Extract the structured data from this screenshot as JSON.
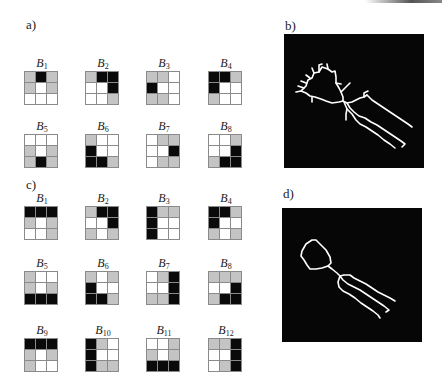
{
  "figure": {
    "panels": {
      "a": {
        "label": "a)",
        "blocks": [
          {
            "name": "B",
            "sub": "1",
            "cells": [
              "g",
              "b",
              "g",
              "g",
              "w",
              "g",
              "w",
              "w",
              "w"
            ]
          },
          {
            "name": "B",
            "sub": "2",
            "cells": [
              "g",
              "b",
              "b",
              "w",
              "w",
              "b",
              "w",
              "w",
              "g"
            ]
          },
          {
            "name": "B",
            "sub": "3",
            "cells": [
              "g",
              "g",
              "w",
              "b",
              "w",
              "w",
              "g",
              "g",
              "w"
            ]
          },
          {
            "name": "B",
            "sub": "4",
            "cells": [
              "b",
              "b",
              "g",
              "b",
              "w",
              "w",
              "g",
              "w",
              "w"
            ]
          },
          {
            "name": "B",
            "sub": "5",
            "cells": [
              "w",
              "w",
              "w",
              "g",
              "w",
              "g",
              "g",
              "b",
              "g"
            ]
          },
          {
            "name": "B",
            "sub": "6",
            "cells": [
              "g",
              "w",
              "w",
              "b",
              "w",
              "w",
              "b",
              "b",
              "g"
            ]
          },
          {
            "name": "B",
            "sub": "7",
            "cells": [
              "w",
              "g",
              "g",
              "w",
              "w",
              "b",
              "w",
              "g",
              "g"
            ]
          },
          {
            "name": "B",
            "sub": "8",
            "cells": [
              "w",
              "w",
              "g",
              "w",
              "w",
              "b",
              "g",
              "b",
              "b"
            ]
          }
        ]
      },
      "b": {
        "label": "b)",
        "description": "Skeleton image of object with spurious branches (white lines on black)"
      },
      "c": {
        "label": "c)",
        "blocks": [
          {
            "name": "B",
            "sub": "1",
            "cells": [
              "b",
              "b",
              "b",
              "g",
              "w",
              "g",
              "w",
              "w",
              "g"
            ]
          },
          {
            "name": "B",
            "sub": "2",
            "cells": [
              "g",
              "b",
              "b",
              "w",
              "w",
              "b",
              "g",
              "w",
              "g"
            ]
          },
          {
            "name": "B",
            "sub": "3",
            "cells": [
              "b",
              "g",
              "g",
              "b",
              "w",
              "w",
              "b",
              "w",
              "w"
            ]
          },
          {
            "name": "B",
            "sub": "4",
            "cells": [
              "b",
              "b",
              "g",
              "b",
              "w",
              "w",
              "g",
              "w",
              "g"
            ]
          },
          {
            "name": "B",
            "sub": "5",
            "cells": [
              "g",
              "w",
              "w",
              "g",
              "w",
              "g",
              "b",
              "b",
              "b"
            ]
          },
          {
            "name": "B",
            "sub": "6",
            "cells": [
              "g",
              "w",
              "g",
              "b",
              "w",
              "w",
              "b",
              "b",
              "g"
            ]
          },
          {
            "name": "B",
            "sub": "7",
            "cells": [
              "w",
              "g",
              "b",
              "w",
              "w",
              "b",
              "g",
              "g",
              "b"
            ]
          },
          {
            "name": "B",
            "sub": "8",
            "cells": [
              "g",
              "g",
              "g",
              "w",
              "w",
              "b",
              "g",
              "b",
              "b"
            ]
          },
          {
            "name": "B",
            "sub": "9",
            "cells": [
              "b",
              "b",
              "b",
              "g",
              "w",
              "g",
              "g",
              "w",
              "w"
            ]
          },
          {
            "name": "B",
            "sub": "10",
            "cells": [
              "b",
              "g",
              "w",
              "b",
              "w",
              "w",
              "b",
              "g",
              "g"
            ]
          },
          {
            "name": "B",
            "sub": "11",
            "cells": [
              "w",
              "w",
              "g",
              "g",
              "w",
              "g",
              "b",
              "b",
              "b"
            ]
          },
          {
            "name": "B",
            "sub": "12",
            "cells": [
              "g",
              "g",
              "b",
              "w",
              "w",
              "b",
              "w",
              "g",
              "b"
            ]
          }
        ]
      },
      "d": {
        "label": "d)",
        "description": "Pruned skeleton image (white lines on black)"
      }
    },
    "colors": {
      "white_cell": "#ffffff",
      "gray_cell": "#c4c4c4",
      "black_cell": "#0a0a0a",
      "image_background": "#060606",
      "skeleton_line": "#ffffff"
    }
  }
}
